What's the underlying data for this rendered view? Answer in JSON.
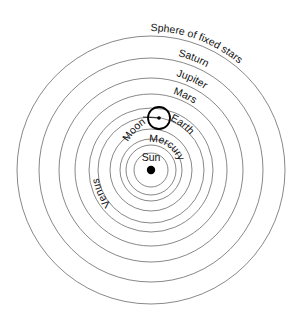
{
  "diagram": {
    "center": {
      "x": 151,
      "y": 170
    },
    "colors": {
      "orbit": "#6a6a6a",
      "ink": "#000000",
      "background": "#ffffff"
    },
    "sun": {
      "label": "Sun",
      "radius": 4
    },
    "orbits": [
      {
        "name": "inner-1",
        "radius": 17
      },
      {
        "name": "mercury-inner",
        "radius": 25
      },
      {
        "name": "mercury",
        "radius": 31
      },
      {
        "name": "venus",
        "radius": 41
      },
      {
        "name": "earth",
        "radius": 53
      },
      {
        "name": "earth-outer",
        "radius": 62
      },
      {
        "name": "mars",
        "radius": 76
      },
      {
        "name": "jupiter",
        "radius": 92
      },
      {
        "name": "saturn",
        "radius": 112
      },
      {
        "name": "fixed-stars",
        "radius": 134
      }
    ],
    "labels": {
      "fixed_stars": "Sphere of fixed stars",
      "saturn": "Saturn",
      "jupiter": "Jupiter",
      "mars": "Mars",
      "moon": "Moon",
      "earth": "Earth",
      "venus": "Venus",
      "mercury": "Mercury",
      "sun": "Sun"
    },
    "earth_epicycle": {
      "cx": 159,
      "cy": 118,
      "radius": 11
    }
  }
}
